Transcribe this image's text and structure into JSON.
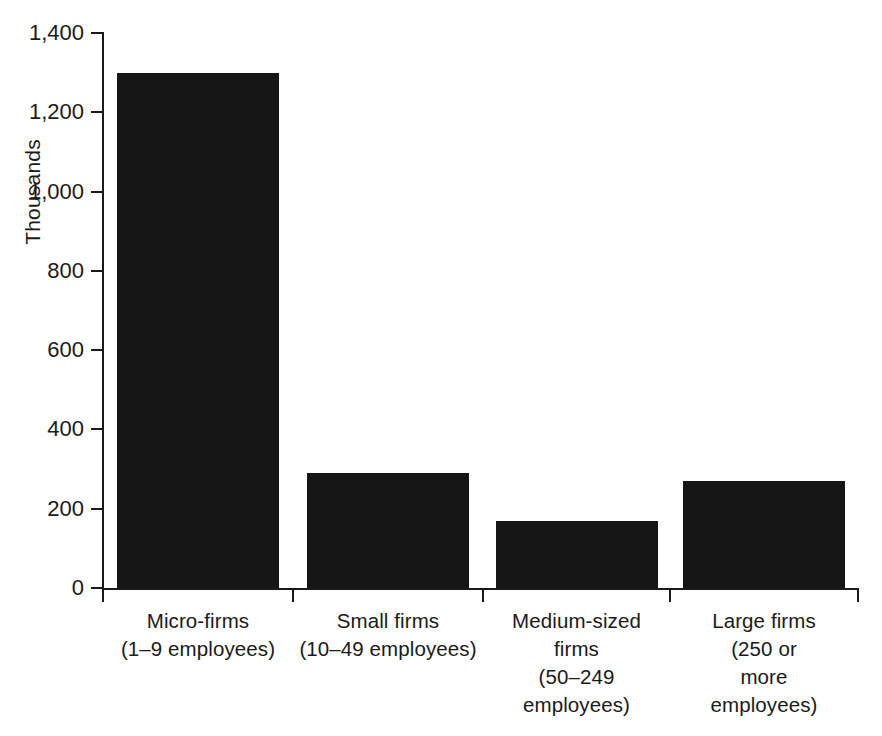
{
  "chart_data": {
    "type": "bar",
    "title": "",
    "subtitle": "",
    "xlabel": "",
    "ylabel": "Thousands",
    "categories": [
      "Micro-firms (1–9 employees)",
      "Small firms (10–49 employees)",
      "Medium-sized firms (50–249 employees)",
      "Large firms (250 or more employees)"
    ],
    "values": [
      1300,
      290,
      170,
      270
    ],
    "ylim": [
      0,
      1400
    ],
    "ytick_step": 200,
    "ytick_labels": [
      "0",
      "200",
      "400",
      "600",
      "800",
      "1,000",
      "1,200",
      "1,400"
    ],
    "ytick_values": [
      0,
      200,
      400,
      600,
      800,
      1000,
      1200,
      1400
    ],
    "grid": false,
    "legend": false,
    "legend_position": "none",
    "bar_color": "#161616",
    "axis_color": "#1a1a1a",
    "background_color": "#ffffff"
  },
  "axis": {
    "y_title": "Thousands",
    "ticks": [
      {
        "label": "1,400",
        "value": 1400
      },
      {
        "label": "1,200",
        "value": 1200
      },
      {
        "label": "1,000",
        "value": 1000
      },
      {
        "label": "800",
        "value": 800
      },
      {
        "label": "600",
        "value": 600
      },
      {
        "label": "400",
        "value": 400
      },
      {
        "label": "200",
        "value": 200
      },
      {
        "label": "0",
        "value": 0
      }
    ]
  },
  "categories": [
    {
      "name": "Micro-firms",
      "range": "(1–9 employees)",
      "lines": [
        "Micro-firms",
        "(1–9 employees)"
      ],
      "value": 1300
    },
    {
      "name": "Small firms",
      "range": "(10–49 employees)",
      "lines": [
        "Small firms",
        "(10–49 employees)"
      ],
      "value": 290
    },
    {
      "name": "Medium-sized firms",
      "range": "(50–249 employees)",
      "lines": [
        "Medium-sized",
        "firms",
        "(50–249",
        "employees)"
      ],
      "value": 170
    },
    {
      "name": "Large firms",
      "range": "(250 or more employees)",
      "lines": [
        "Large firms",
        "(250 or",
        "more",
        "employees)"
      ],
      "value": 270
    }
  ]
}
